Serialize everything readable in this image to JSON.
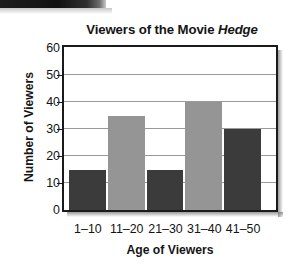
{
  "chart_data": {
    "type": "bar",
    "title": "Viewers of the Movie Hedge",
    "title_plain": "Viewers of the Movie ",
    "title_emphasis": "Hedge",
    "xlabel": "Age of Viewers",
    "ylabel": "Number of Viewers",
    "categories": [
      "1–10",
      "11–20",
      "21–30",
      "31–40",
      "41–50"
    ],
    "values": [
      15,
      35,
      15,
      40,
      30
    ],
    "bar_colors": [
      "#3b3b3b",
      "#959595",
      "#3b3b3b",
      "#959595",
      "#3b3b3b"
    ],
    "ylim": [
      0,
      60
    ],
    "ytick_step": 10,
    "yticks": [
      0,
      10,
      20,
      30,
      40,
      50,
      60
    ],
    "ytick_labels": [
      "0",
      "10",
      "20",
      "30",
      "40",
      "50",
      "60"
    ],
    "grid": true,
    "grid_axis": "y",
    "grid_color": "#9a9a9a",
    "legend": false,
    "frame_color": "#1a1a1a",
    "plot_background": "#ffffff"
  },
  "artifacts": {
    "scan_bar_label": "scan-smudge-artifact"
  }
}
